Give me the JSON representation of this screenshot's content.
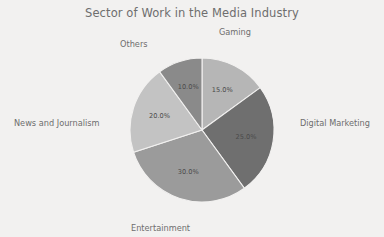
{
  "chart_data": {
    "type": "pie",
    "title": "Sector of Work in the Media Industry",
    "categories": [
      "Gaming",
      "Digital Marketing",
      "Entertainment",
      "News and Journalism",
      "Others"
    ],
    "values": [
      15.0,
      25.0,
      30.0,
      20.0,
      10.0
    ],
    "value_labels": [
      "15.0%",
      "25.0%",
      "30.0%",
      "20.0%",
      "10.0%"
    ],
    "colors": [
      "#b6b6b6",
      "#6f6f6f",
      "#9b9b9b",
      "#c3c3c3",
      "#8a8a8a"
    ],
    "start_angle_deg": 0,
    "direction": "clockwise",
    "legend": "none",
    "grid": false,
    "label_position": "outside",
    "autopct_position": "inside",
    "background_color": "#f2f1f0",
    "title_color": "#6e6e6e",
    "label_color": "#6e6e6e",
    "autopct_color": "#4b4b4b",
    "wedge_edge_color": "#f2f1f0",
    "center": {
      "x": 202,
      "y": 130
    },
    "radius": 72,
    "slices": [
      {
        "label": "Gaming",
        "value": 15.0,
        "pct_text": "15.0%",
        "color": "#b6b6b6"
      },
      {
        "label": "Digital Marketing",
        "value": 25.0,
        "pct_text": "25.0%",
        "color": "#6f6f6f"
      },
      {
        "label": "Entertainment",
        "value": 30.0,
        "pct_text": "30.0%",
        "color": "#9b9b9b"
      },
      {
        "label": "News and Journalism",
        "value": 20.0,
        "pct_text": "20.0%",
        "color": "#c3c3c3"
      },
      {
        "label": "Others",
        "value": 10.0,
        "pct_text": "10.0%",
        "color": "#8a8a8a"
      }
    ]
  }
}
